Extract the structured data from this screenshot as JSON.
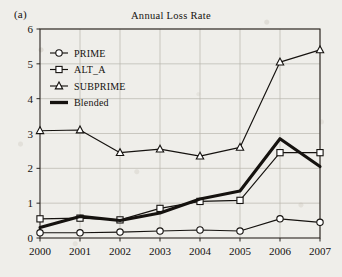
{
  "figure": {
    "panel_label": "(a)",
    "title": "Annual Loss Rate"
  },
  "chart_data": {
    "type": "line",
    "title": "Annual Loss Rate",
    "xlabel": "",
    "ylabel": "",
    "categories": [
      "2000",
      "2001",
      "2002",
      "2003",
      "2004",
      "2005",
      "2006",
      "2007"
    ],
    "x": [
      2000,
      2001,
      2002,
      2003,
      2004,
      2005,
      2006,
      2007
    ],
    "ylim": [
      0,
      6
    ],
    "yticks": [
      "0",
      "1",
      "2",
      "3",
      "4",
      "5",
      "6"
    ],
    "grid": true,
    "legend_position": "upper-left-inside",
    "series": [
      {
        "name": "PRIME",
        "marker": "circle",
        "values": [
          0.15,
          0.15,
          0.17,
          0.2,
          0.23,
          0.2,
          0.55,
          0.45
        ]
      },
      {
        "name": "ALT_A",
        "marker": "square",
        "values": [
          0.55,
          0.57,
          0.52,
          0.85,
          1.05,
          1.08,
          2.45,
          2.45
        ]
      },
      {
        "name": "SUBPRIME",
        "marker": "triangle",
        "values": [
          3.08,
          3.1,
          2.45,
          2.55,
          2.35,
          2.6,
          5.05,
          5.4
        ]
      },
      {
        "name": "Blended",
        "marker": "none",
        "values": [
          0.3,
          0.62,
          0.5,
          0.72,
          1.12,
          1.35,
          2.85,
          2.05
        ]
      }
    ]
  },
  "legend": {
    "items": [
      {
        "label": "PRIME",
        "marker": "circle"
      },
      {
        "label": "ALT_A",
        "marker": "square"
      },
      {
        "label": "SUBPRIME",
        "marker": "triangle"
      },
      {
        "label": "Blended",
        "marker": "bar"
      }
    ]
  },
  "colors": {
    "ink": "#15120f",
    "grid": "#b9b6ae",
    "axis": "#2a2520",
    "paper": "#efeeea",
    "marker_fill": "#ffffff"
  }
}
